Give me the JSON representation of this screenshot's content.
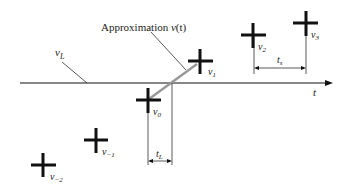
{
  "diagram": {
    "annotation": {
      "text": "Approximation ",
      "var": "v",
      "arg": "(t)"
    },
    "level_label": {
      "base": "v",
      "sub": "L"
    },
    "axis_label": "t",
    "interval_labels": {
      "tL": {
        "base": "t",
        "sub": "L"
      },
      "ts": {
        "base": "t",
        "sub": "s"
      }
    },
    "samples": [
      {
        "base": "v",
        "sub": "−2"
      },
      {
        "base": "v",
        "sub": "−1"
      },
      {
        "base": "v",
        "sub": "0"
      },
      {
        "base": "v",
        "sub": "1"
      },
      {
        "base": "v",
        "sub": "2"
      },
      {
        "base": "v",
        "sub": "3"
      }
    ],
    "colors": {
      "ink": "#111111",
      "approx_line": "#999999"
    }
  }
}
